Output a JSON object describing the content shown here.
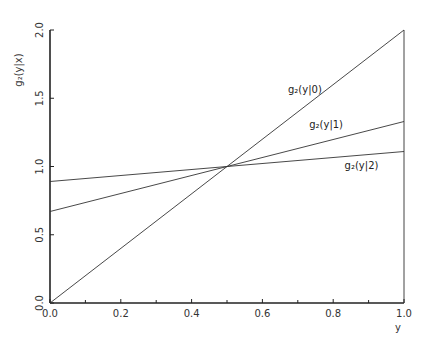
{
  "chart_data": {
    "type": "line",
    "title": "",
    "xlabel": "y",
    "ylabel": "g₂(y|x)",
    "xlim": [
      0.0,
      1.0
    ],
    "ylim": [
      0.0,
      2.0
    ],
    "grid": false,
    "legend_position": "inline labels",
    "x_ticks": [
      "0.0",
      "0.2",
      "0.4",
      "0.6",
      "0.8",
      "1.0"
    ],
    "x_minor_ticks": [
      0.1,
      0.3,
      0.5,
      0.7,
      0.9
    ],
    "y_ticks": [
      "0.0",
      "0.5",
      "1.0",
      "1.5",
      "2.0"
    ],
    "x": [
      0.0,
      0.5,
      1.0
    ],
    "series": [
      {
        "name": "g₂(y|0)",
        "values": [
          0.0,
          1.0,
          2.0
        ]
      },
      {
        "name": "g₂(y|1)",
        "values": [
          0.67,
          1.0,
          1.33
        ]
      },
      {
        "name": "g₂(y|2)",
        "values": [
          0.89,
          1.0,
          1.11
        ]
      }
    ],
    "annotations": [
      {
        "text": "g₂(y|0)",
        "x": 0.72,
        "y": 1.54
      },
      {
        "text": "g₂(y|1)",
        "x": 0.78,
        "y": 1.28
      },
      {
        "text": "g₂(y|2)",
        "x": 0.88,
        "y": 0.98
      }
    ]
  }
}
